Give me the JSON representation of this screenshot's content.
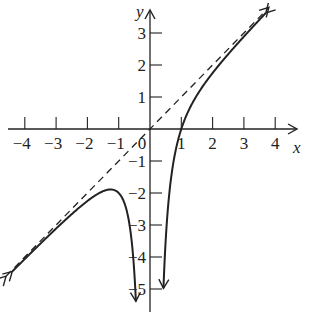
{
  "chart_data": {
    "type": "line",
    "title": "",
    "xlabel": "x",
    "ylabel": "y",
    "xlim": [
      -4.5,
      4.5
    ],
    "ylim": [
      -5.5,
      3.7
    ],
    "grid": false,
    "legend": null,
    "x_ticks": [
      -4,
      -3,
      -2,
      -1,
      0,
      1,
      2,
      3,
      4
    ],
    "x_tick_labels": [
      "−4",
      "−3",
      "−2",
      "−1",
      "0",
      "1",
      "2",
      "3",
      "4"
    ],
    "y_ticks": [
      3,
      2,
      1,
      -1,
      -2,
      -3,
      -4,
      -5
    ],
    "y_tick_labels": [
      "3",
      "2",
      "1",
      "−1",
      "−2",
      "−3",
      "−4",
      "−5"
    ],
    "series": [
      {
        "name": "f(x) = x − 1/x²",
        "style": "solid",
        "branches": [
          {
            "x": [
              -4.4,
              -3,
              -2,
              -1.26,
              -1,
              -0.6,
              -0.45
            ],
            "y": [
              -4.45,
              -3.11,
              -2.25,
              -1.89,
              -2.0,
              -3.38,
              -5.39
            ]
          },
          {
            "x": [
              0.43,
              0.6,
              0.8,
              1,
              1.5,
              2,
              3,
              3.7
            ],
            "y": [
              -4.98,
              -2.18,
              -0.76,
              0,
              1.06,
              1.75,
              2.89,
              3.63
            ]
          }
        ],
        "vertical_asymptote": 0,
        "x_intercept": 1,
        "local_max": {
          "x": -1.26,
          "y": -1.89
        }
      },
      {
        "name": "y = x (slant asymptote)",
        "style": "dashed",
        "x": [
          -4.6,
          3.8
        ],
        "y": [
          -4.6,
          3.8
        ]
      }
    ],
    "annotations": []
  }
}
